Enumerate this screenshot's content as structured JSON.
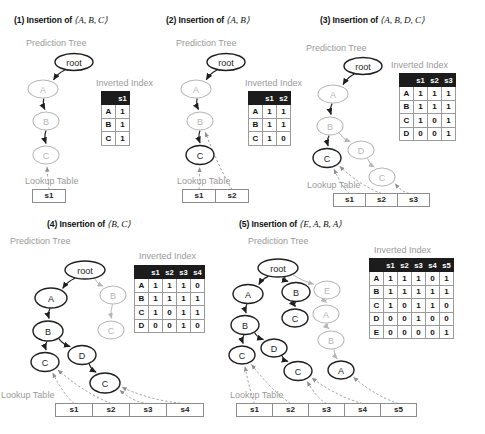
{
  "figure": {
    "panels": [
      {
        "id": "panel-1",
        "title_prefix": "(1) Insertion of",
        "sequence": "⟨A, B, C⟩",
        "tree_label": "Prediction Tree",
        "index_label": "Inverted Index",
        "lookup_label": "Lookup Table",
        "tree_nodes": [
          {
            "label": "root",
            "x": 74,
            "y": 62,
            "rx": 19,
            "ry": 8.5,
            "style": "dark"
          },
          {
            "label": "A",
            "x": 43,
            "y": 89,
            "rx": 15,
            "ry": 9,
            "style": "light"
          },
          {
            "label": "B",
            "x": 46,
            "y": 121,
            "rx": 13,
            "ry": 9,
            "style": "light"
          },
          {
            "label": "C",
            "x": 46,
            "y": 155,
            "rx": 13,
            "ry": 9,
            "style": "light"
          }
        ],
        "inverted_index": {
          "columns": [
            "s1"
          ],
          "rows": [
            {
              "item": "A",
              "values": [
                "1"
              ]
            },
            {
              "item": "B",
              "values": [
                "1"
              ]
            },
            {
              "item": "C",
              "values": [
                "1"
              ]
            }
          ]
        },
        "lookup_cells": [
          "s1"
        ]
      },
      {
        "id": "panel-2",
        "title_prefix": "(2) Insertion of",
        "sequence": "⟨A, B⟩",
        "tree_label": "Prediction Tree",
        "index_label": "Inverted Index",
        "lookup_label": "Lookup Table",
        "tree_nodes": [
          {
            "label": "root",
            "x": 226,
            "y": 62,
            "rx": 19,
            "ry": 8.5,
            "style": "dark"
          },
          {
            "label": "A",
            "x": 196,
            "y": 89,
            "rx": 15,
            "ry": 9,
            "style": "light"
          },
          {
            "label": "B",
            "x": 200,
            "y": 121,
            "rx": 13,
            "ry": 9,
            "style": "light"
          },
          {
            "label": "C",
            "x": 200,
            "y": 155,
            "rx": 14,
            "ry": 9.5,
            "style": "dark"
          }
        ],
        "inverted_index": {
          "columns": [
            "s1",
            "s2"
          ],
          "rows": [
            {
              "item": "A",
              "values": [
                "1",
                "1"
              ]
            },
            {
              "item": "B",
              "values": [
                "1",
                "1"
              ]
            },
            {
              "item": "C",
              "values": [
                "1",
                "0"
              ]
            }
          ]
        },
        "lookup_cells": [
          "s1",
          "s2"
        ]
      },
      {
        "id": "panel-3",
        "title_prefix": "(3) Insertion of",
        "sequence": "⟨A, B, D, C⟩",
        "tree_label": "Prediction Tree",
        "index_label": "Inverted Index",
        "lookup_label": "Lookup Table",
        "tree_nodes": [
          {
            "label": "root",
            "x": 363,
            "y": 66,
            "rx": 19,
            "ry": 8.5,
            "style": "dark"
          },
          {
            "label": "A",
            "x": 333,
            "y": 94,
            "rx": 15,
            "ry": 9,
            "style": "light"
          },
          {
            "label": "B",
            "x": 330,
            "y": 126,
            "rx": 13,
            "ry": 9,
            "style": "light"
          },
          {
            "label": "C",
            "x": 327,
            "y": 158,
            "rx": 14,
            "ry": 9.5,
            "style": "dark"
          },
          {
            "label": "D",
            "x": 361,
            "y": 150,
            "rx": 13,
            "ry": 9,
            "style": "light"
          },
          {
            "label": "C",
            "x": 382,
            "y": 177,
            "rx": 13,
            "ry": 9,
            "style": "light"
          }
        ],
        "inverted_index": {
          "columns": [
            "s1",
            "s2",
            "s3"
          ],
          "rows": [
            {
              "item": "A",
              "values": [
                "1",
                "1",
                "1"
              ]
            },
            {
              "item": "B",
              "values": [
                "1",
                "1",
                "1"
              ]
            },
            {
              "item": "C",
              "values": [
                "1",
                "0",
                "1"
              ]
            },
            {
              "item": "D",
              "values": [
                "0",
                "0",
                "1"
              ]
            }
          ]
        },
        "lookup_cells": [
          "s1",
          "s2",
          "s3"
        ]
      },
      {
        "id": "panel-4",
        "title_prefix": "(4) Insertion of",
        "sequence": "⟨B, C⟩",
        "tree_label": "Prediction Tree",
        "index_label": "Inverted Index",
        "lookup_label": "Lookup Table",
        "tree_nodes": [
          {
            "label": "root",
            "x": 85,
            "y": 270,
            "rx": 20,
            "ry": 9,
            "style": "dark"
          },
          {
            "label": "A",
            "x": 51,
            "y": 298,
            "rx": 16,
            "ry": 10,
            "style": "dark"
          },
          {
            "label": "B",
            "x": 113,
            "y": 295,
            "rx": 13,
            "ry": 9,
            "style": "light"
          },
          {
            "label": "B",
            "x": 48,
            "y": 331,
            "rx": 15,
            "ry": 10,
            "style": "dark"
          },
          {
            "label": "C",
            "x": 111,
            "y": 330,
            "rx": 13,
            "ry": 9,
            "style": "light"
          },
          {
            "label": "C",
            "x": 45,
            "y": 362,
            "rx": 14,
            "ry": 9.5,
            "style": "dark"
          },
          {
            "label": "D",
            "x": 82,
            "y": 355,
            "rx": 14,
            "ry": 9.5,
            "style": "dark"
          },
          {
            "label": "C",
            "x": 105,
            "y": 383,
            "rx": 15,
            "ry": 10,
            "style": "dark"
          }
        ],
        "inverted_index": {
          "columns": [
            "s1",
            "s2",
            "s3",
            "s4"
          ],
          "rows": [
            {
              "item": "A",
              "values": [
                "1",
                "1",
                "1",
                "0"
              ]
            },
            {
              "item": "B",
              "values": [
                "1",
                "1",
                "1",
                "1"
              ]
            },
            {
              "item": "C",
              "values": [
                "1",
                "0",
                "1",
                "1"
              ]
            },
            {
              "item": "D",
              "values": [
                "0",
                "0",
                "1",
                "0"
              ]
            }
          ]
        },
        "lookup_cells": [
          "s1",
          "s2",
          "s3",
          "s4"
        ]
      },
      {
        "id": "panel-5",
        "title_prefix": "(5) Insertion of",
        "sequence": "⟨E, A, B, A⟩",
        "tree_label": "Prediction Tree",
        "index_label": "Inverted Index",
        "lookup_label": "Lookup Table",
        "tree_nodes": [
          {
            "label": "root",
            "x": 278,
            "y": 268,
            "rx": 20,
            "ry": 9,
            "style": "dark"
          },
          {
            "label": "A",
            "x": 248,
            "y": 294,
            "rx": 15,
            "ry": 9.5,
            "style": "dark"
          },
          {
            "label": "B",
            "x": 296,
            "y": 292,
            "rx": 14,
            "ry": 9.5,
            "style": "dark"
          },
          {
            "label": "E",
            "x": 327,
            "y": 290,
            "rx": 13,
            "ry": 9,
            "style": "light"
          },
          {
            "label": "B",
            "x": 245,
            "y": 325,
            "rx": 14,
            "ry": 9.5,
            "style": "dark"
          },
          {
            "label": "C",
            "x": 295,
            "y": 318,
            "rx": 13,
            "ry": 9,
            "style": "dark"
          },
          {
            "label": "A",
            "x": 326,
            "y": 314,
            "rx": 13,
            "ry": 9,
            "style": "light"
          },
          {
            "label": "C",
            "x": 242,
            "y": 355,
            "rx": 13,
            "ry": 9,
            "style": "dark"
          },
          {
            "label": "D",
            "x": 274,
            "y": 348,
            "rx": 13,
            "ry": 9,
            "style": "dark"
          },
          {
            "label": "B",
            "x": 331,
            "y": 340,
            "rx": 13,
            "ry": 9,
            "style": "light"
          },
          {
            "label": "C",
            "x": 298,
            "y": 371,
            "rx": 14,
            "ry": 9.5,
            "style": "dark"
          },
          {
            "label": "A",
            "x": 341,
            "y": 370,
            "rx": 13,
            "ry": 9,
            "style": "dark"
          }
        ],
        "inverted_index": {
          "columns": [
            "s1",
            "s2",
            "s3",
            "s4",
            "s5"
          ],
          "rows": [
            {
              "item": "A",
              "values": [
                "1",
                "1",
                "1",
                "0",
                "1"
              ]
            },
            {
              "item": "B",
              "values": [
                "1",
                "1",
                "1",
                "1",
                "1"
              ]
            },
            {
              "item": "C",
              "values": [
                "1",
                "0",
                "1",
                "1",
                "0"
              ]
            },
            {
              "item": "D",
              "values": [
                "0",
                "0",
                "1",
                "0",
                "0"
              ]
            },
            {
              "item": "E",
              "values": [
                "0",
                "0",
                "0",
                "0",
                "1"
              ]
            }
          ]
        },
        "lookup_cells": [
          "s1",
          "s2",
          "s3",
          "s4",
          "s5"
        ]
      }
    ]
  },
  "colors": {
    "node_dark": "#1f1f1f",
    "node_light": "#b6b6b6",
    "label_gray": "#9a9a9a",
    "header_bg": "#1c1c1c",
    "grid": "#9b9b9b"
  }
}
